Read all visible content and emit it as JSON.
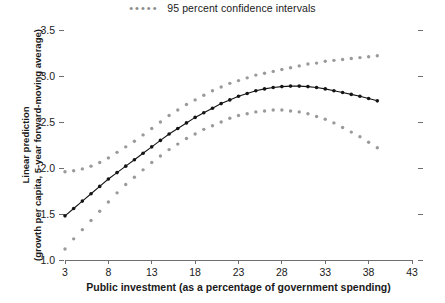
{
  "legend": {
    "marker_glyph": "•••••",
    "label": "95 percent confidence intervals",
    "marker_color": "#8c8c8c",
    "position": "top-center"
  },
  "axes": {
    "y_title_line1": "Linear prediction",
    "y_title_line2": "(growth per capita, 5-year forward-moving average)",
    "x_title": "Public investment (as a percentage of government spending)",
    "y_ticks": [
      "1.0",
      "1.5",
      "2.0",
      "2.5",
      "3.0",
      "3.5"
    ],
    "x_ticks": [
      "3",
      "8",
      "13",
      "18",
      "23",
      "28",
      "33",
      "38",
      "43"
    ]
  },
  "colors": {
    "line": "#141414",
    "ci": "#9a9a9a",
    "axis": "#6e6e6e",
    "text": "#1a1a1a",
    "background": "#ffffff"
  },
  "chart_data": {
    "type": "line",
    "title": "",
    "subtitle": "",
    "xlabel": "Public investment (as a percentage of government spending)",
    "ylabel": "Linear prediction (growth per capita, 5-year forward-moving average)",
    "xlim": [
      3,
      43
    ],
    "ylim": [
      1.0,
      3.5
    ],
    "xticks": [
      3,
      8,
      13,
      18,
      23,
      28,
      33,
      38,
      43
    ],
    "yticks": [
      1.0,
      1.5,
      2.0,
      2.5,
      3.0,
      3.5
    ],
    "grid": false,
    "legend_position": "top-center",
    "x": [
      3,
      4,
      5,
      6,
      7,
      8,
      9,
      10,
      11,
      12,
      13,
      14,
      15,
      16,
      17,
      18,
      19,
      20,
      21,
      22,
      23,
      24,
      25,
      26,
      27,
      28,
      29,
      30,
      31,
      32,
      33,
      34,
      35,
      36,
      37,
      38,
      39
    ],
    "series": [
      {
        "name": "Linear prediction",
        "style": "solid-with-markers",
        "color": "#141414",
        "values": [
          1.48,
          1.56,
          1.64,
          1.72,
          1.8,
          1.88,
          1.95,
          2.02,
          2.09,
          2.16,
          2.23,
          2.3,
          2.37,
          2.43,
          2.49,
          2.55,
          2.6,
          2.65,
          2.7,
          2.74,
          2.78,
          2.81,
          2.84,
          2.86,
          2.875,
          2.885,
          2.89,
          2.89,
          2.885,
          2.875,
          2.86,
          2.84,
          2.82,
          2.8,
          2.78,
          2.755,
          2.73
        ]
      },
      {
        "name": "95 percent confidence intervals (upper)",
        "style": "dotted",
        "color": "#9a9a9a",
        "values": [
          1.96,
          1.97,
          1.99,
          2.02,
          2.06,
          2.11,
          2.17,
          2.23,
          2.29,
          2.36,
          2.43,
          2.5,
          2.57,
          2.63,
          2.69,
          2.74,
          2.79,
          2.84,
          2.88,
          2.92,
          2.95,
          2.98,
          3.01,
          3.03,
          3.05,
          3.07,
          3.09,
          3.11,
          3.13,
          3.14,
          3.16,
          3.17,
          3.18,
          3.19,
          3.2,
          3.21,
          3.22
        ]
      },
      {
        "name": "95 percent confidence intervals (lower)",
        "style": "dotted",
        "color": "#9a9a9a",
        "values": [
          1.12,
          1.23,
          1.33,
          1.43,
          1.53,
          1.63,
          1.73,
          1.82,
          1.9,
          1.98,
          2.06,
          2.13,
          2.2,
          2.26,
          2.32,
          2.37,
          2.42,
          2.46,
          2.5,
          2.54,
          2.57,
          2.59,
          2.61,
          2.62,
          2.63,
          2.63,
          2.62,
          2.61,
          2.59,
          2.56,
          2.53,
          2.49,
          2.44,
          2.39,
          2.34,
          2.28,
          2.22
        ]
      }
    ]
  }
}
